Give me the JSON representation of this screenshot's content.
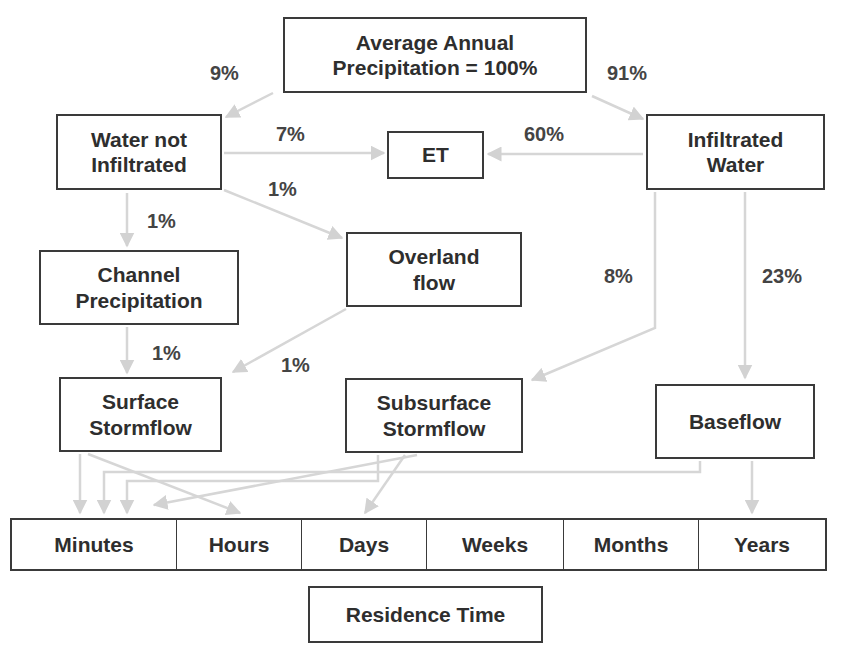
{
  "nodes": {
    "precipitation": "Average Annual\nPrecipitation = 100%",
    "water_not_infiltrated": "Water not\nInfiltrated",
    "et": "ET",
    "infiltrated_water": "Infiltrated\nWater",
    "channel_precipitation": "Channel\nPrecipitation",
    "overland_flow": "Overland\nflow",
    "surface_stormflow": "Surface\nStormflow",
    "subsurface_stormflow": "Subsurface\nStormflow",
    "baseflow": "Baseflow",
    "residence_time": "Residence Time"
  },
  "flows": {
    "precip_to_not_infiltrated": "9%",
    "precip_to_infiltrated": "91%",
    "not_infiltrated_to_et": "7%",
    "infiltrated_to_et": "60%",
    "not_infiltrated_to_overland": "1%",
    "not_infiltrated_to_channel": "1%",
    "channel_to_surface": "1%",
    "overland_to_surface": "1%",
    "infiltrated_to_subsurface": "8%",
    "infiltrated_to_baseflow": "23%"
  },
  "time_scale": [
    {
      "label": "Minutes",
      "width": 165
    },
    {
      "label": "Hours",
      "width": 125
    },
    {
      "label": "Days",
      "width": 125
    },
    {
      "label": "Weeks",
      "width": 137
    },
    {
      "label": "Months",
      "width": 135
    },
    {
      "label": "Years",
      "width": 130
    }
  ],
  "colors": {
    "box_border": "#3a3a3a",
    "arrow": "#d4d4d4",
    "text": "#2e2e2e"
  }
}
